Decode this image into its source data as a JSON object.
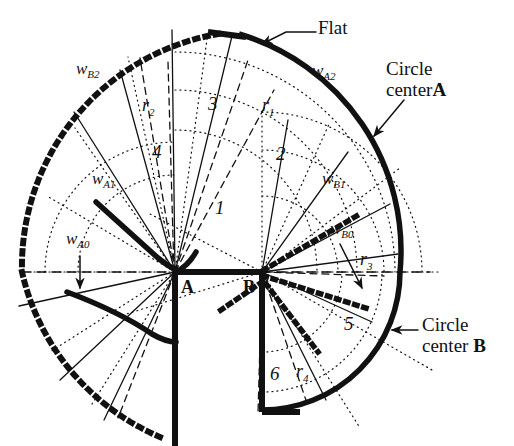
{
  "figure": {
    "type": "technical-line-diagram",
    "width": 514,
    "height": 446,
    "background_color": "#ffffff",
    "ink_color": "#111111"
  },
  "points": {
    "a": {
      "label": "A",
      "x": 175,
      "y": 272
    },
    "b": {
      "label": "B",
      "x": 262,
      "y": 272
    }
  },
  "annotations": {
    "flat": {
      "label": "Flat",
      "x": 318,
      "y": 28
    },
    "circle_center_a": {
      "line1": "Circle",
      "line2": "center",
      "bold": "A",
      "x": 386,
      "y": 68
    },
    "circle_center_b": {
      "line1": "Circle",
      "line2": "center",
      "bold": "B",
      "x": 422,
      "y": 324
    }
  },
  "wedge_labels": [
    {
      "name": "w_A0",
      "base": "w",
      "sub": "A0",
      "x": 66,
      "y": 238
    },
    {
      "name": "w_A1",
      "base": "w",
      "sub": "A1",
      "x": 92,
      "y": 178
    },
    {
      "name": "w_A2",
      "base": "w",
      "sub": "A2",
      "x": 312,
      "y": 70
    },
    {
      "name": "w_B0",
      "base": "w",
      "sub": "B0",
      "x": 330,
      "y": 228
    },
    {
      "name": "w_B1",
      "base": "w",
      "sub": "B1",
      "x": 322,
      "y": 178
    },
    {
      "name": "w_B2",
      "base": "w",
      "sub": "B2",
      "x": 76,
      "y": 68
    }
  ],
  "radius_labels": [
    {
      "name": "r_1",
      "base": "r",
      "sub": "1",
      "x": 262,
      "y": 104
    },
    {
      "name": "r_2",
      "base": "r",
      "sub": "2",
      "x": 142,
      "y": 104
    },
    {
      "name": "r_3",
      "base": "r",
      "sub": "3",
      "x": 360,
      "y": 258
    },
    {
      "name": "r_4",
      "base": "r",
      "sub": "4",
      "x": 296,
      "y": 370
    }
  ],
  "region_numbers": [
    {
      "label": "1",
      "x": 215,
      "y": 206
    },
    {
      "label": "2",
      "x": 276,
      "y": 152
    },
    {
      "label": "3",
      "x": 208,
      "y": 102
    },
    {
      "label": "4",
      "x": 152,
      "y": 150
    },
    {
      "label": "5",
      "x": 344,
      "y": 322
    },
    {
      "label": "6",
      "x": 270,
      "y": 372
    }
  ],
  "line_styles": {
    "thick_solid": {
      "width": 5,
      "dash": "none",
      "role": "circle-arc-boundary-and-flat"
    },
    "thick_square_dotted": {
      "width": 5,
      "dash": "2 7",
      "cap": "square",
      "role": "wB2-and-wB-boundaries"
    },
    "thin_solid": {
      "width": 1.2,
      "dash": "none",
      "role": "sector-dividing-rays"
    },
    "thin_dotted": {
      "width": 1.2,
      "dash": "1 4",
      "role": "construction-arcs-and-rays"
    },
    "thin_dashed": {
      "width": 1.2,
      "dash": "7 5",
      "role": "radius-lines-r1-r4"
    },
    "center_dashed": {
      "width": 1.4,
      "dash": "9 6",
      "role": "horizontal-axis-through-A-and-B"
    }
  }
}
